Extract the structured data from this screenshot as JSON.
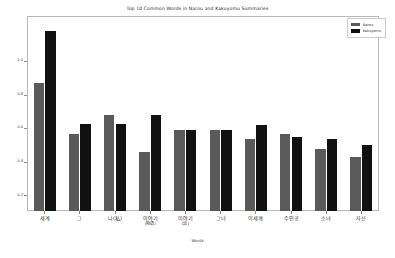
{
  "chart_data": {
    "type": "bar",
    "title": "Top 10 Common Words in Narou and Kakuyomu Summaries",
    "xlabel": "Words",
    "ylabel": "Frequency / Norm. TF",
    "categories": [
      "세계",
      "그",
      "나(私)",
      "이야기\n(物語)",
      "이야기\n(話)",
      "그녀",
      "이세계",
      "주인공",
      "소녀",
      "자신"
    ],
    "series": [
      {
        "name": "Narou",
        "color": "#5a5a5a",
        "values": [
          0.87,
          0.57,
          0.68,
          0.46,
          0.59,
          0.59,
          0.54,
          0.57,
          0.48,
          0.43
        ]
      },
      {
        "name": "Kakuyomu",
        "color": "#111111",
        "values": [
          1.18,
          0.63,
          0.63,
          0.68,
          0.59,
          0.59,
          0.62,
          0.55,
          0.54,
          0.5
        ]
      }
    ],
    "ylim": [
      0.11,
      1.27
    ],
    "yticks": [
      0.2,
      0.4,
      0.6,
      0.8,
      1.0
    ],
    "ytick_labels": [
      "0.2",
      "0.4",
      "0.6",
      "0.8",
      "1.0"
    ],
    "grid": false,
    "legend_position": "upper right"
  },
  "legend": {
    "entries": [
      {
        "label": "Narou",
        "swatch": "narou"
      },
      {
        "label": "Kakuyomu",
        "swatch": "kakuyomu"
      }
    ]
  }
}
